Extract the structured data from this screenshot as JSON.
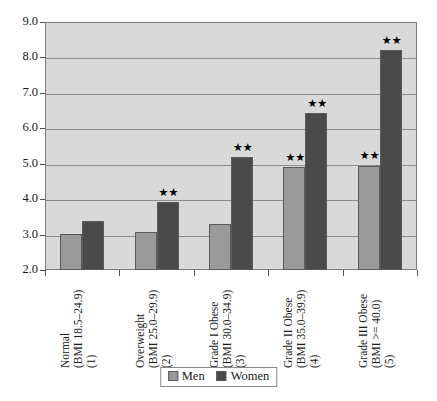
{
  "chart_data": {
    "type": "bar",
    "title": "",
    "subtitle": "",
    "xlabel": "",
    "ylabel": "",
    "ylim": [
      2.0,
      9.0
    ],
    "ytick_labels": [
      "9.0",
      "8.0",
      "7.0",
      "6.0",
      "5.0",
      "4.0",
      "3.0",
      "2.0"
    ],
    "ytick_values": [
      9.0,
      8.0,
      7.0,
      6.0,
      5.0,
      4.0,
      3.0,
      2.0
    ],
    "grid": true,
    "legend_position": "bottom-center",
    "categories": [
      "Normal\n(BMI 18.5–24.9)\n(1)",
      "Overweight\n(BMI 25.0–29.9)\n(2)",
      "Grade I Obese\n(BMI 30.0–34.9)\n(3)",
      "Grade II Obese\n(BMI 35.0–39.9)\n(4)",
      "Grade III Obese\n(BMI >= 40.0)\n(5)"
    ],
    "category_lines": [
      [
        "Normal",
        "(BMI 18.5–24.9)",
        "(1)"
      ],
      [
        "Overweight",
        "(BMI 25.0–29.9)",
        "(2)"
      ],
      [
        "Grade I Obese",
        "(BMI 30.0–34.9)",
        "(3)"
      ],
      [
        "Grade II Obese",
        "(BMI 35.0–39.9)",
        "(4)"
      ],
      [
        "Grade III Obese",
        "(BMI >= 40.0)",
        "(5)"
      ]
    ],
    "series": [
      {
        "name": "Men",
        "color": "#9a9a9a",
        "values": [
          3.03,
          3.08,
          3.3,
          4.9,
          4.95
        ]
      },
      {
        "name": "Women",
        "color": "#4a4a4a",
        "values": [
          3.37,
          3.92,
          5.2,
          6.42,
          8.2
        ]
      }
    ],
    "annotations": [
      {
        "series": "Women",
        "category_index": 1,
        "text": "★★"
      },
      {
        "series": "Women",
        "category_index": 2,
        "text": "★★"
      },
      {
        "series": "Men",
        "category_index": 3,
        "text": "★★"
      },
      {
        "series": "Women",
        "category_index": 3,
        "text": "★★"
      },
      {
        "series": "Men",
        "category_index": 4,
        "text": "★★"
      },
      {
        "series": "Women",
        "category_index": 4,
        "text": "★★"
      }
    ],
    "significance_symbol": "★★"
  },
  "legend": {
    "items": [
      {
        "label": "Men",
        "swatch": "men-swatch"
      },
      {
        "label": "Women",
        "swatch": "women-swatch"
      }
    ]
  },
  "colors": {
    "men_bar": "#9a9a9a",
    "women_bar": "#4a4a4a",
    "plot_background": "#d9d9d9",
    "gridline": "#8c8c8c",
    "axis": "#4d4d4d",
    "text": "#1a1a1a"
  }
}
